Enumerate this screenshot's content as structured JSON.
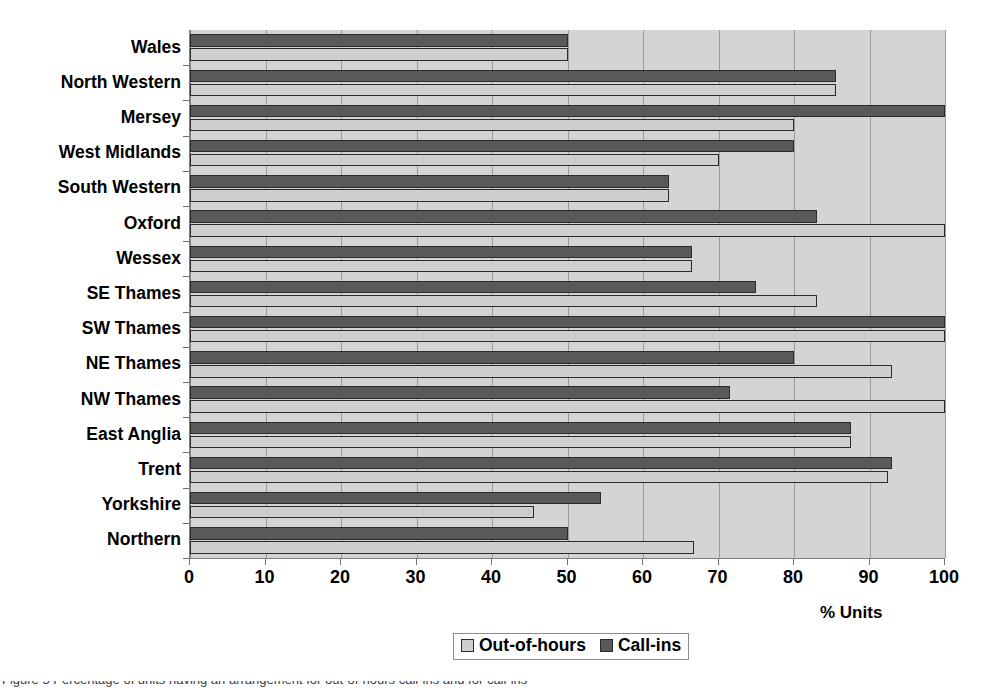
{
  "chart_data": {
    "type": "bar",
    "orientation": "horizontal",
    "title": "",
    "xlabel": "% Units",
    "ylabel": "",
    "xlim": [
      0,
      100
    ],
    "xticks": [
      0,
      10,
      20,
      30,
      40,
      50,
      60,
      70,
      80,
      90,
      100
    ],
    "xticklabels": [
      "0",
      "10",
      "20",
      "30",
      "40",
      "50",
      "60",
      "70",
      "80",
      "90",
      "100"
    ],
    "grid": "vertical",
    "legend_position": "bottom-center",
    "categories": [
      "Wales",
      "North Western",
      "Mersey",
      "West Midlands",
      "South Western",
      "Oxford",
      "Wessex",
      "SE Thames",
      "SW Thames",
      "NE Thames",
      "NW Thames",
      "East Anglia",
      "Trent",
      "Yorkshire",
      "Northern"
    ],
    "series": [
      {
        "name": "Call-ins",
        "color": "#595959",
        "values": [
          50.0,
          85.5,
          100.0,
          80.0,
          63.5,
          83.0,
          66.5,
          75.0,
          100.0,
          80.0,
          71.5,
          87.5,
          93.0,
          54.5,
          50.0
        ]
      },
      {
        "name": "Out-of-hours",
        "color": "#cfcfcf",
        "values": [
          50.0,
          85.5,
          80.0,
          70.0,
          63.5,
          100.0,
          66.5,
          83.0,
          100.0,
          93.0,
          100.0,
          87.5,
          92.5,
          45.5,
          66.7
        ]
      }
    ]
  },
  "legend": {
    "entries": [
      {
        "label": "Out-of-hours",
        "swatch": "outofhours"
      },
      {
        "label": "Call-ins",
        "swatch": "callins"
      }
    ]
  },
  "axis": {
    "x_title": "% Units"
  },
  "caption": {
    "text": "Figure 5 Percentage of units having an arrangement for out-of-hours call-ins and for call-ins"
  },
  "colors": {
    "plot_background": "#d4d4d4",
    "gridline": "#9a9a9a",
    "axis": "#808080",
    "bar_outline": "#2b2b2b",
    "call_ins": "#595959",
    "out_of_hours": "#cfcfcf",
    "text": "#000000"
  }
}
